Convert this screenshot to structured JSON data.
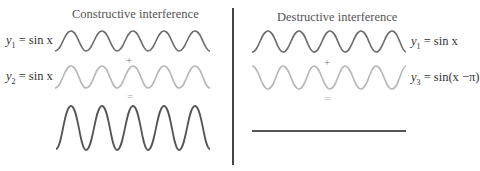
{
  "left_panel": {
    "title": "Constructive interference",
    "labels": [
      {
        "var": "y",
        "sub": "1",
        "rhs": " = sin x"
      },
      {
        "var": "y",
        "sub": "2",
        "rhs": " = sin x"
      }
    ],
    "operators": {
      "plus": "+",
      "equals": "="
    }
  },
  "right_panel": {
    "title": "Destructive interference",
    "labels": [
      {
        "var": "y",
        "sub": "1",
        "rhs": " = sin x"
      },
      {
        "var": "y",
        "sub": "3",
        "rhs": " = sin(x −π)"
      }
    ],
    "operators": {
      "plus": "+",
      "equals": "="
    }
  },
  "colors": {
    "dark_wave": "#6e6e6e",
    "light_wave": "#b8b8b8",
    "result_wave": "#555555",
    "divider": "#444444"
  }
}
